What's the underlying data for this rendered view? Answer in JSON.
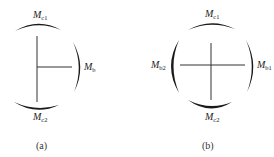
{
  "figure_a": {
    "caption": "(a)",
    "labels": {
      "top": {
        "main": "M",
        "sub": "c1"
      },
      "right": {
        "main": "M",
        "sub": "b"
      },
      "bottom": {
        "main": "M",
        "sub": "c2"
      }
    }
  },
  "figure_b": {
    "caption": "(b)",
    "labels": {
      "top": {
        "main": "M",
        "sub": "c1"
      },
      "left": {
        "main": "M",
        "sub": "b2"
      },
      "right": {
        "main": "M",
        "sub": "b1"
      },
      "bottom": {
        "main": "M",
        "sub": "c2"
      }
    }
  },
  "colors": {
    "stroke": "#333333",
    "arc": "#1a1a1a",
    "background": "#ffffff"
  }
}
